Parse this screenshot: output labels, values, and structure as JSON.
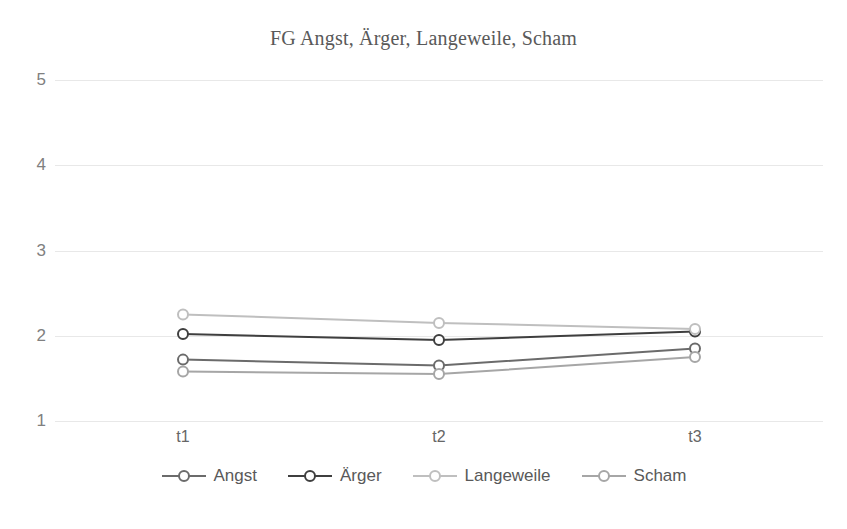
{
  "chart_data": {
    "type": "line",
    "title": "FG Angst, Ärger, Langeweile, Scham",
    "xlabel": "",
    "ylabel": "",
    "categories": [
      "t1",
      "t2",
      "t3"
    ],
    "ylim": [
      1,
      5
    ],
    "yticks": [
      1,
      2,
      3,
      4,
      5
    ],
    "ytick_labels": [
      "1",
      "2",
      "3",
      "4",
      "5"
    ],
    "grid": true,
    "legend_position": "bottom",
    "marker": "open-circle",
    "series": [
      {
        "name": "Angst",
        "values": [
          1.72,
          1.65,
          1.85
        ],
        "color": "#6b6b6b"
      },
      {
        "name": "Ärger",
        "values": [
          2.02,
          1.95,
          2.05
        ],
        "color": "#3f3f3f"
      },
      {
        "name": "Langeweile",
        "values": [
          2.25,
          2.15,
          2.08
        ],
        "color": "#bfbfbf"
      },
      {
        "name": "Scham",
        "values": [
          1.58,
          1.55,
          1.75
        ],
        "color": "#a6a6a6"
      }
    ]
  },
  "axis": {
    "y_tick_labels": [
      "5",
      "4",
      "3",
      "2",
      "1"
    ],
    "x_tick_labels": [
      "t1",
      "t2",
      "t3"
    ]
  },
  "legend": {
    "items": [
      {
        "label": "Angst"
      },
      {
        "label": "Ärger"
      },
      {
        "label": "Langeweile"
      },
      {
        "label": "Scham"
      }
    ]
  },
  "colors": {
    "gridline": "#e8e8e8",
    "title_text": "#595959",
    "tick_text": "#808080",
    "background": "#ffffff"
  }
}
